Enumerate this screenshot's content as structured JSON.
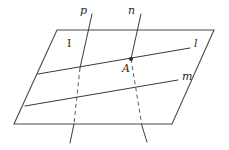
{
  "figure": {
    "kind": "geometry-diagram",
    "background_color": "#ffffff",
    "stroke_color": "#3a3a3a",
    "plane_edge_color": "#4a4a4a",
    "hidden_line_color": "#5a5a5a",
    "point_color": "#2f2f2f"
  },
  "labels": {
    "plane": "I",
    "line_p": "p",
    "line_n": "n",
    "line_l": "l",
    "line_m": "m",
    "point_a": "A"
  },
  "geometry": {
    "plane_polygon": "57,30 214,30 172,124 14,124",
    "line_l": {
      "x1": 38,
      "y1": 74,
      "x2": 190,
      "y2": 48
    },
    "line_m": {
      "x1": 25,
      "y1": 106,
      "x2": 178,
      "y2": 80
    },
    "line_p_visible_top": {
      "x1": 92,
      "y1": 14,
      "x2": 80,
      "y2": 68
    },
    "line_p_hidden": {
      "x1": 80,
      "y1": 68,
      "x2": 74,
      "y2": 124
    },
    "line_p_visible_bottom": {
      "x1": 74,
      "y1": 124,
      "x2": 70,
      "y2": 143
    },
    "line_n_visible_top": {
      "x1": 141,
      "y1": 14,
      "x2": 131,
      "y2": 59
    },
    "line_n_hidden": {
      "x1": 131,
      "y1": 59,
      "x2": 142,
      "y2": 126
    },
    "line_n_visible_bottom": {
      "x1": 142,
      "y1": 126,
      "x2": 147,
      "y2": 142
    },
    "point_a": {
      "x": 131,
      "y": 59
    },
    "point_a_radius": 2
  },
  "label_positions": {
    "plane": {
      "x": 67,
      "y": 47
    },
    "line_p": {
      "x": 80,
      "y": 14
    },
    "line_n": {
      "x": 128,
      "y": 14
    },
    "line_l": {
      "x": 194,
      "y": 47
    },
    "line_m": {
      "x": 182,
      "y": 80
    },
    "point_a": {
      "x": 122,
      "y": 72
    }
  }
}
